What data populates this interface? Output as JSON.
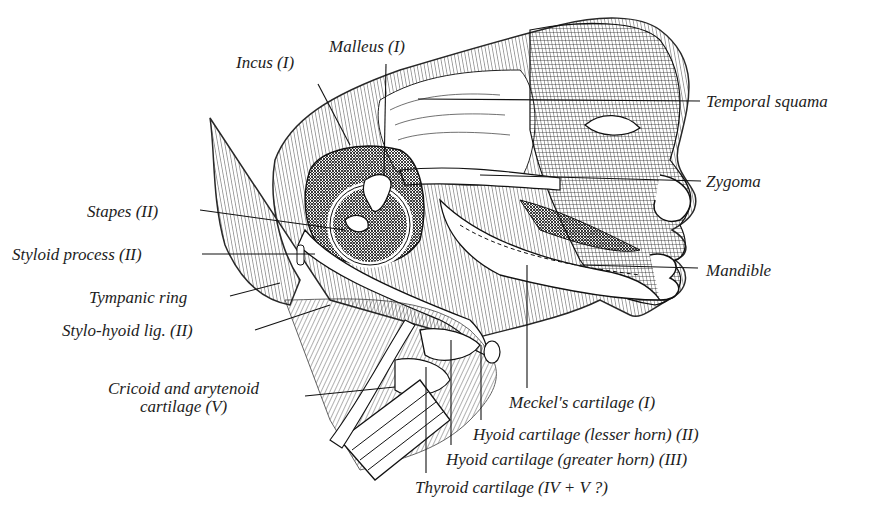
{
  "figure": {
    "labels": [
      {
        "id": "incus",
        "text": "Incus (I)",
        "x": 236,
        "y": 54,
        "align": "left",
        "leader": [
          [
            318,
            84
          ],
          [
            350,
            145
          ]
        ]
      },
      {
        "id": "malleus",
        "text": "Malleus (I)",
        "x": 329,
        "y": 38,
        "align": "left",
        "leader": [
          [
            386,
            64
          ],
          [
            384,
            175
          ]
        ]
      },
      {
        "id": "temporal-squama",
        "text": "Temporal squama",
        "x": 706,
        "y": 93,
        "align": "left",
        "leader": [
          [
            700,
            101
          ],
          [
            418,
            99
          ]
        ]
      },
      {
        "id": "zygoma",
        "text": "Zygoma",
        "x": 706,
        "y": 173,
        "align": "left",
        "leader": [
          [
            701,
            181
          ],
          [
            480,
            175
          ]
        ]
      },
      {
        "id": "stapes",
        "text": "Stapes (II)",
        "x": 87,
        "y": 203,
        "align": "left",
        "leader": [
          [
            200,
            210
          ],
          [
            345,
            230
          ]
        ]
      },
      {
        "id": "styloid-process",
        "text": "Styloid process (II)",
        "x": 12,
        "y": 246,
        "align": "left",
        "leader": [
          [
            202,
            254
          ],
          [
            315,
            254
          ]
        ]
      },
      {
        "id": "mandible",
        "text": "Mandible",
        "x": 706,
        "y": 262,
        "align": "left",
        "leader": [
          [
            698,
            268
          ],
          [
            580,
            265
          ]
        ]
      },
      {
        "id": "tympanic-ring",
        "text": "Tympanic ring",
        "x": 89,
        "y": 289,
        "align": "left",
        "leader": [
          [
            230,
            296
          ],
          [
            280,
            283
          ]
        ]
      },
      {
        "id": "stylo-hyoid-lig",
        "text": "Stylo-hyoid lig. (II)",
        "x": 62,
        "y": 322,
        "align": "left",
        "leader": [
          [
            255,
            330
          ],
          [
            330,
            305
          ]
        ]
      },
      {
        "id": "cricoid-arytenoid",
        "text": "Cricoid and arytenoid\ncartilage (V)",
        "x": 108,
        "y": 380,
        "align": "center",
        "leader": [
          [
            305,
            396
          ],
          [
            395,
            387
          ]
        ]
      },
      {
        "id": "meckels-cartilage",
        "text": "Meckel's cartilage (I)",
        "x": 509,
        "y": 394,
        "align": "left",
        "leader": [
          [
            527,
            388
          ],
          [
            527,
            265
          ]
        ]
      },
      {
        "id": "hyoid-lesser",
        "text": "Hyoid cartilage (lesser horn) (II)",
        "x": 473,
        "y": 426,
        "align": "left",
        "leader": [
          [
            481,
            420
          ],
          [
            481,
            345
          ]
        ]
      },
      {
        "id": "hyoid-greater",
        "text": "Hyoid cartilage (greater horn) (III)",
        "x": 446,
        "y": 451,
        "align": "left",
        "leader": [
          [
            451,
            445
          ],
          [
            451,
            340
          ]
        ]
      },
      {
        "id": "thyroid-cartilage",
        "text": "Thyroid cartilage (IV + V ?)",
        "x": 415,
        "y": 479,
        "align": "left",
        "leader": [
          [
            426,
            473
          ],
          [
            426,
            367
          ]
        ]
      }
    ]
  },
  "style": {
    "ink": "#1a1a1a",
    "paper": "#ffffff"
  }
}
